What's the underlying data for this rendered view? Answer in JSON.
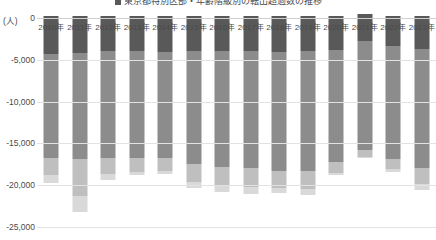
{
  "title": {
    "text": "転出超過数の推移（年齢階級別）",
    "legend_note": "東京都特別区部・年齢階級別の転出超過数の推移"
  },
  "axis": {
    "unit_label": "(人)",
    "y_ticks": [
      "0",
      "-5,000",
      "-10,000",
      "-15,000",
      "-20,000",
      "-25,000"
    ],
    "x_labels": [
      "2010年",
      "2011年",
      "2012年",
      "2013年",
      "2014年",
      "2015年",
      "2016年",
      "2017年",
      "2018年",
      "2019年",
      "2020年",
      "2021年",
      "2022年",
      "2023年"
    ]
  },
  "colors": {
    "seg_dark": "#595959",
    "seg_mid": "#8c8c8c",
    "seg_light": "#bfbfbf",
    "seg_pale": "#d9d9d9",
    "gridline": "#e2e2e2",
    "zero_line": "#cfcfcf",
    "text": "#4a4a4a"
  },
  "chart_data": {
    "type": "bar",
    "xlabel": "",
    "ylabel": "(人)",
    "ylim": [
      -25000,
      1000
    ],
    "grid": true,
    "legend_position": "top",
    "stacked": true,
    "categories": [
      "2010年",
      "2011年",
      "2012年",
      "2013年",
      "2014年",
      "2015年",
      "2016年",
      "2017年",
      "2018年",
      "2019年",
      "2020年",
      "2021年",
      "2022年",
      "2023年"
    ],
    "series": [
      {
        "name": "上位層（濃灰）",
        "color": "#595959",
        "values": [
          -4300,
          -4200,
          -4000,
          -3900,
          -4100,
          -4000,
          -4000,
          -4000,
          -4100,
          -4000,
          -3800,
          -2800,
          -3300,
          -3700
        ]
      },
      {
        "name": "主層（中灰）",
        "color": "#8c8c8c",
        "values": [
          -12400,
          -12700,
          -12800,
          -12900,
          -12700,
          -13500,
          -13800,
          -14000,
          -14200,
          -14300,
          -13400,
          -13000,
          -13600,
          -14200
        ]
      },
      {
        "name": "下位層（淡灰）",
        "color": "#bfbfbf",
        "values": [
          -2100,
          -4400,
          -1900,
          -1600,
          -1500,
          -2100,
          -2200,
          -2200,
          -2000,
          -2200,
          -1300,
          -800,
          -1200,
          -2000
        ]
      },
      {
        "name": "最下層（薄灰）",
        "color": "#d9d9d9",
        "values": [
          -900,
          -1900,
          -700,
          -400,
          -400,
          -700,
          -800,
          -800,
          -600,
          -700,
          -300,
          -200,
          -300,
          -700
        ]
      }
    ],
    "positive_series": [
      {
        "name": "転入超過（正値）",
        "color": "#595959",
        "values": [
          260,
          260,
          250,
          250,
          250,
          250,
          250,
          250,
          250,
          250,
          250,
          520,
          260,
          230
        ]
      }
    ],
    "totals": [
      -19700,
      -23200,
      -19400,
      -18800,
      -18700,
      -20300,
      -20800,
      -21000,
      -20900,
      -21200,
      -18800,
      -16800,
      -18400,
      -20600
    ]
  }
}
